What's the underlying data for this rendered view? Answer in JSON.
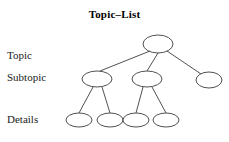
{
  "title": "Topic–List",
  "colors": {
    "stroke": "#3d3d3d",
    "node_fill": "#ffffff",
    "background": "#ffffff",
    "text": "#1a1a1a"
  },
  "labels": {
    "topic": "Topic",
    "subtopic": "Subtopic",
    "details": "Details"
  },
  "diagram": {
    "type": "tree",
    "levels": [
      {
        "name": "topic",
        "label": "Topic",
        "nodes": [
          {
            "id": "root",
            "cx": 158,
            "cy": 44,
            "rx": 15,
            "ry": 9
          }
        ]
      },
      {
        "name": "subtopic",
        "label": "Subtopic",
        "nodes": [
          {
            "id": "sub1",
            "cx": 97,
            "cy": 79,
            "rx": 15,
            "ry": 8
          },
          {
            "id": "sub2",
            "cx": 147,
            "cy": 79,
            "rx": 15,
            "ry": 8
          },
          {
            "id": "sub3",
            "cx": 209,
            "cy": 80,
            "rx": 13,
            "ry": 8
          }
        ]
      },
      {
        "name": "details",
        "label": "Details",
        "nodes": [
          {
            "id": "det1",
            "cx": 79,
            "cy": 120,
            "rx": 13,
            "ry": 7
          },
          {
            "id": "det2",
            "cx": 110,
            "cy": 120,
            "rx": 13,
            "ry": 7
          },
          {
            "id": "det3",
            "cx": 136,
            "cy": 120,
            "rx": 13,
            "ry": 7
          },
          {
            "id": "det4",
            "cx": 166,
            "cy": 120,
            "rx": 13,
            "ry": 7
          }
        ]
      }
    ],
    "edges": [
      {
        "from": "root",
        "to": "sub1",
        "x1": 150,
        "y1": 51,
        "x2": 100,
        "y2": 71
      },
      {
        "from": "root",
        "to": "sub2",
        "x1": 158,
        "y1": 53,
        "x2": 147,
        "y2": 71
      },
      {
        "from": "root",
        "to": "sub3",
        "x1": 167,
        "y1": 51,
        "x2": 201,
        "y2": 74
      },
      {
        "from": "sub1",
        "to": "det1",
        "x1": 93,
        "y1": 87,
        "x2": 79,
        "y2": 113
      },
      {
        "from": "sub1",
        "to": "det2",
        "x1": 102,
        "y1": 87,
        "x2": 110,
        "y2": 113
      },
      {
        "from": "sub2",
        "to": "det3",
        "x1": 143,
        "y1": 87,
        "x2": 136,
        "y2": 113
      },
      {
        "from": "sub2",
        "to": "det4",
        "x1": 152,
        "y1": 87,
        "x2": 166,
        "y2": 113
      }
    ]
  }
}
